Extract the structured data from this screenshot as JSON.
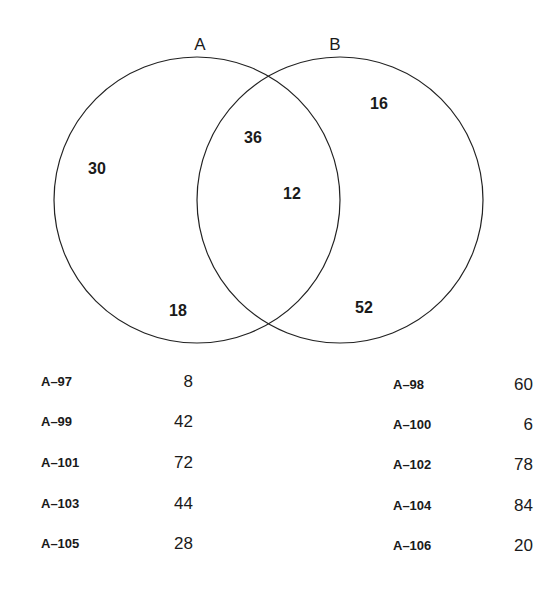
{
  "diagram": {
    "sets": [
      {
        "label": "A"
      },
      {
        "label": "B"
      }
    ],
    "regions": [
      {
        "id": "a-only-upper",
        "value": "30"
      },
      {
        "id": "a-only-lower",
        "value": "18"
      },
      {
        "id": "intersection-upper",
        "value": "36"
      },
      {
        "id": "intersection-center",
        "value": "12"
      },
      {
        "id": "b-only-upper",
        "value": "16"
      },
      {
        "id": "b-only-lower",
        "value": "52"
      }
    ]
  },
  "choices": {
    "left": [
      {
        "label": "A–97",
        "value": "8"
      },
      {
        "label": "A–99",
        "value": "42"
      },
      {
        "label": "A–101",
        "value": "72"
      },
      {
        "label": "A–103",
        "value": "44"
      },
      {
        "label": "A–105",
        "value": "28"
      }
    ],
    "right": [
      {
        "label": "A–98",
        "value": "60"
      },
      {
        "label": "A–100",
        "value": "6"
      },
      {
        "label": "A–102",
        "value": "78"
      },
      {
        "label": "A–104",
        "value": "84"
      },
      {
        "label": "A–106",
        "value": "20"
      }
    ]
  }
}
